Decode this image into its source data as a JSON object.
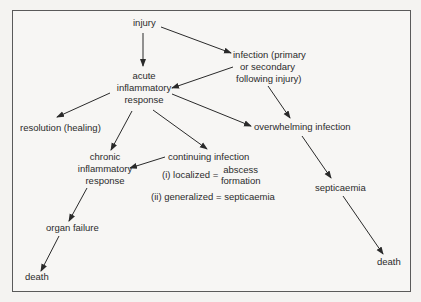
{
  "diagram": {
    "type": "flowchart",
    "nodes": {
      "injury": "injury",
      "infection": [
        "infection (primary",
        "or secondary",
        "following injury)"
      ],
      "acute": [
        "acute",
        "inflammatory",
        "response"
      ],
      "resolution": "resolution (healing)",
      "overwhelming": "overwhelming infection",
      "chronic": [
        "chronic",
        "inflammatory",
        "response"
      ],
      "continuing": {
        "title": "continuing infection",
        "localized_prefix": "(i) localized =",
        "localized_result": [
          "abscess",
          "formation"
        ],
        "generalized": "(ii) generalized = septicaemia"
      },
      "septicaemia": "septicaemia",
      "organ_failure": "organ failure",
      "death_left": "death",
      "death_right": "death"
    },
    "edges": [
      {
        "from": "injury",
        "to": "acute"
      },
      {
        "from": "injury",
        "to": "infection"
      },
      {
        "from": "infection",
        "to": "acute"
      },
      {
        "from": "infection",
        "to": "overwhelming"
      },
      {
        "from": "acute",
        "to": "resolution"
      },
      {
        "from": "acute",
        "to": "chronic"
      },
      {
        "from": "acute",
        "to": "continuing"
      },
      {
        "from": "acute",
        "to": "overwhelming"
      },
      {
        "from": "continuing",
        "to": "chronic"
      },
      {
        "from": "chronic",
        "to": "organ_failure"
      },
      {
        "from": "organ_failure",
        "to": "death_left"
      },
      {
        "from": "overwhelming",
        "to": "septicaemia"
      },
      {
        "from": "septicaemia",
        "to": "death_right"
      }
    ],
    "colors": {
      "line": "#2a2a2a",
      "frame": "#5a5a5a",
      "background": "#f4f3f1"
    }
  }
}
